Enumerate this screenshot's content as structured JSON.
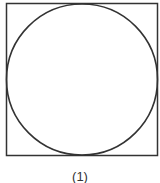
{
  "figure": {
    "caption": "(1)",
    "shapes": [
      {
        "type": "square",
        "x": 6,
        "y": 3,
        "size": 152,
        "stroke": "#333333"
      },
      {
        "type": "circle",
        "cx": 82,
        "cy": 79,
        "r": 76,
        "stroke": "#333333",
        "inscribed": true
      }
    ]
  }
}
